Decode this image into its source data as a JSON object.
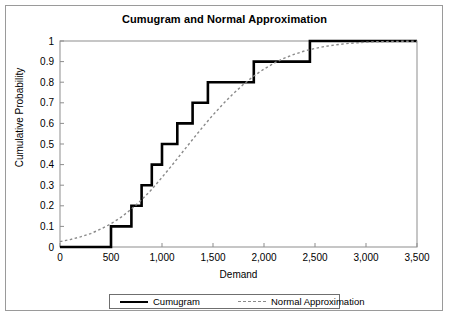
{
  "figure": {
    "title": "Cumugram and Normal Approximation",
    "frame_color": "#9a9a9a",
    "background": "#ffffff"
  },
  "axes": {
    "xlabel": "Demand",
    "ylabel": "Cumulative Probability",
    "x_ticks": [
      "0",
      "500",
      "1,000",
      "1,500",
      "2,000",
      "2,500",
      "3,000",
      "3,500"
    ],
    "y_ticks": [
      "0",
      "0.1",
      "0.2",
      "0.3",
      "0.4",
      "0.5",
      "0.6",
      "0.7",
      "0.8",
      "0.9",
      "1"
    ]
  },
  "legend": {
    "position": "bottom",
    "items": [
      {
        "label": "Cumugram",
        "style": "solid",
        "color": "#000000",
        "width": 2.6
      },
      {
        "label": "Normal Approximation",
        "style": "dashed",
        "color": "#8a8a8a",
        "width": 1.4
      }
    ]
  },
  "chart_data": {
    "type": "line",
    "title": "Cumugram and Normal Approximation",
    "xlabel": "Demand",
    "ylabel": "Cumulative Probability",
    "xlim": [
      0,
      3500
    ],
    "ylim": [
      0,
      1
    ],
    "xtick_values": [
      0,
      500,
      1000,
      1500,
      2000,
      2500,
      3000,
      3500
    ],
    "ytick_values": [
      0,
      0.1,
      0.2,
      0.3,
      0.4,
      0.5,
      0.6,
      0.7,
      0.8,
      0.9,
      1
    ],
    "grid": false,
    "legend_position": "bottom",
    "series": [
      {
        "name": "Cumugram",
        "type": "step",
        "style": "solid",
        "color": "#000000",
        "x": [
          0,
          500,
          500,
          700,
          700,
          800,
          800,
          900,
          900,
          1000,
          1000,
          1150,
          1150,
          1300,
          1300,
          1450,
          1450,
          1900,
          1900,
          2450,
          2450,
          3500
        ],
        "y": [
          0,
          0,
          0.1,
          0.1,
          0.2,
          0.2,
          0.3,
          0.3,
          0.4,
          0.4,
          0.5,
          0.5,
          0.6,
          0.6,
          0.7,
          0.7,
          0.8,
          0.8,
          0.9,
          0.9,
          1.0,
          1.0
        ],
        "steps": [
          {
            "demand": 500,
            "cumulative_probability": 0.1
          },
          {
            "demand": 700,
            "cumulative_probability": 0.2
          },
          {
            "demand": 800,
            "cumulative_probability": 0.3
          },
          {
            "demand": 900,
            "cumulative_probability": 0.4
          },
          {
            "demand": 1000,
            "cumulative_probability": 0.5
          },
          {
            "demand": 1150,
            "cumulative_probability": 0.6
          },
          {
            "demand": 1300,
            "cumulative_probability": 0.7
          },
          {
            "demand": 1450,
            "cumulative_probability": 0.8
          },
          {
            "demand": 1900,
            "cumulative_probability": 0.9
          },
          {
            "demand": 2450,
            "cumulative_probability": 1.0
          }
        ]
      },
      {
        "name": "Normal Approximation",
        "type": "line",
        "style": "dashed",
        "color": "#8a8a8a",
        "mean": 1200,
        "sd": 620,
        "x": [
          0,
          100,
          200,
          300,
          400,
          500,
          600,
          700,
          800,
          900,
          1000,
          1100,
          1200,
          1300,
          1400,
          1500,
          1600,
          1700,
          1800,
          1900,
          2000,
          2100,
          2200,
          2300,
          2400,
          2500,
          2600,
          2700,
          2800,
          2900,
          3000,
          3100,
          3200,
          3300,
          3400,
          3500
        ],
        "y": [
          0.026,
          0.036,
          0.049,
          0.065,
          0.087,
          0.113,
          0.145,
          0.184,
          0.229,
          0.28,
          0.338,
          0.398,
          0.46,
          0.522,
          0.583,
          0.641,
          0.695,
          0.745,
          0.79,
          0.83,
          0.864,
          0.893,
          0.917,
          0.936,
          0.952,
          0.964,
          0.974,
          0.981,
          0.987,
          0.991,
          0.994,
          0.996,
          0.997,
          0.998,
          0.999,
          0.999
        ]
      }
    ]
  }
}
